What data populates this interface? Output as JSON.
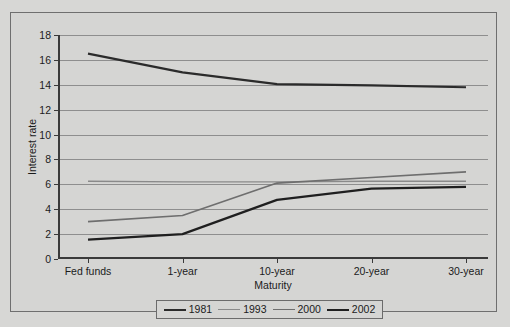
{
  "figure": {
    "background_color": "#d7d7d5",
    "frame_color": "#6f6f6f"
  },
  "axes": {
    "y_axis_title": "Interest rate",
    "x_axis_title": "Maturity",
    "y_ticks": [
      "0",
      "2",
      "4",
      "6",
      "8",
      "10",
      "12",
      "14",
      "16",
      "18"
    ],
    "x_ticks": [
      "Fed funds",
      "1-year",
      "10-year",
      "20-year",
      "30-year"
    ]
  },
  "legend": {
    "entries": [
      {
        "label": "1981",
        "color": "#2b2b2b",
        "width": "2.2"
      },
      {
        "label": "1993",
        "color": "#8a8a8a",
        "width": "1.4"
      },
      {
        "label": "2000",
        "color": "#6e6e6e",
        "width": "1.6"
      },
      {
        "label": "2002",
        "color": "#1f1f1f",
        "width": "2.2"
      }
    ]
  },
  "chart_data": {
    "type": "line",
    "title": "",
    "xlabel": "Maturity",
    "ylabel": "Interest rate",
    "categories": [
      "Fed funds",
      "1-year",
      "10-year",
      "20-year",
      "30-year"
    ],
    "ylim": [
      0,
      18
    ],
    "ytick_step": 2,
    "grid": true,
    "legend_position": "bottom",
    "series": [
      {
        "name": "1981",
        "color": "#2b2b2b",
        "line_width": 2.2,
        "values": [
          16.5,
          15.0,
          14.05,
          13.95,
          13.8
        ]
      },
      {
        "name": "1993",
        "color": "#8a8a8a",
        "line_width": 1.4,
        "values": [
          6.25,
          6.2,
          6.2,
          6.25,
          6.25
        ]
      },
      {
        "name": "2000",
        "color": "#6e6e6e",
        "line_width": 1.6,
        "values": [
          3.0,
          3.5,
          6.1,
          6.55,
          7.0
        ]
      },
      {
        "name": "2002",
        "color": "#1f1f1f",
        "line_width": 2.2,
        "values": [
          1.55,
          2.0,
          4.75,
          5.65,
          5.8
        ]
      }
    ]
  }
}
